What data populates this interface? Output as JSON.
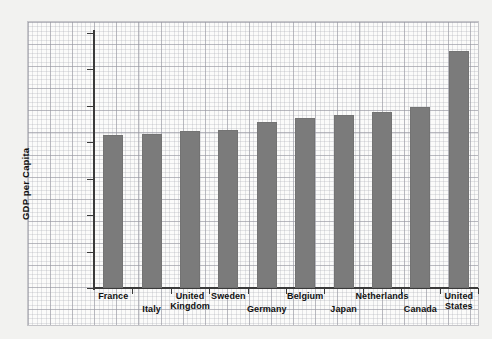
{
  "chart_data": {
    "type": "bar",
    "title": "",
    "xlabel": "",
    "ylabel": "GDP per Capita",
    "categories": [
      "France",
      "Italy",
      "United Kingdom",
      "Sweden",
      "Germany",
      "Belgium",
      "Japan",
      "Netherlands",
      "Canada",
      "United States"
    ],
    "values": [
      21000,
      21200,
      21500,
      21700,
      22800,
      23400,
      23700,
      24100,
      24900,
      32500
    ],
    "ylim": [
      0,
      35000
    ],
    "ytick_values": [
      0,
      5000,
      10000,
      15000,
      20000,
      25000,
      30000,
      35000
    ],
    "ytick_labels": [
      "0",
      "5,000",
      "10,000",
      "15,000",
      "20,000",
      "25,000",
      "30,000",
      "$35,000"
    ],
    "grid": true,
    "grid_style": "graph-paper",
    "legend": null,
    "bar_color": "#7b7b7b",
    "axis_color": "#3a3a3a",
    "background_color": "#fbfbfa",
    "page_background": "#f2f2f0",
    "label_rows": [
      0,
      1,
      0,
      0,
      1,
      0,
      1,
      0,
      1,
      0
    ]
  },
  "axis": {
    "y_title": "GDP per Capita"
  }
}
